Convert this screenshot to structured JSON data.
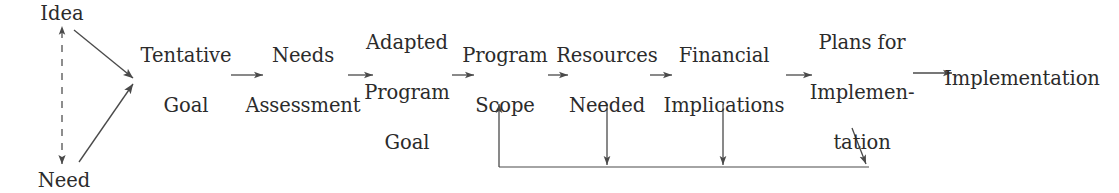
{
  "diagram": {
    "background_color": "#ffffff",
    "ink_color": "#2b2b2b",
    "line_color": "#4a4a4a",
    "inputs": [
      {
        "id": "idea",
        "label": "Idea",
        "cx": 62,
        "cy": 14
      },
      {
        "id": "need",
        "label": "Need",
        "cx": 64,
        "cy": 181
      }
    ],
    "stages": [
      {
        "id": "tentative-goal",
        "lines": [
          "Tentative",
          "Goal"
        ],
        "cx": 186,
        "cy": 80
      },
      {
        "id": "needs-assessment",
        "lines": [
          "Needs",
          "Assessment"
        ],
        "cx": 303,
        "cy": 80
      },
      {
        "id": "adapted-program-goal",
        "lines": [
          "Adapted",
          "Program",
          "Goal"
        ],
        "cx": 407,
        "cy": 92
      },
      {
        "id": "program-scope",
        "lines": [
          "Program",
          "Scope",
          ""
        ],
        "cx": 505,
        "cy": 80
      },
      {
        "id": "resources-needed",
        "lines": [
          "Resources",
          "Needed"
        ],
        "cx": 607,
        "cy": 80
      },
      {
        "id": "financial-implications",
        "lines": [
          "Financial",
          "Implications"
        ],
        "cx": 724,
        "cy": 80
      },
      {
        "id": "plans-for-implementation",
        "lines": [
          "Plans for",
          "Implemen-",
          "tation"
        ],
        "cx": 862,
        "cy": 92
      },
      {
        "id": "implementation",
        "lines": [
          "Implementation"
        ],
        "cx": 1022,
        "cy": 78
      }
    ],
    "forward_arrows": [
      {
        "id": "tentative-to-needs",
        "x1": 231,
        "y1": 75,
        "x2": 263,
        "y2": 75
      },
      {
        "id": "needs-to-adapted",
        "x1": 348,
        "y1": 75,
        "x2": 373,
        "y2": 75
      },
      {
        "id": "adapted-to-scope",
        "x1": 452,
        "y1": 75,
        "x2": 474,
        "y2": 75
      },
      {
        "id": "scope-to-resources",
        "x1": 548,
        "y1": 75,
        "x2": 568,
        "y2": 75
      },
      {
        "id": "resources-to-financial",
        "x1": 650,
        "y1": 75,
        "x2": 672,
        "y2": 75
      },
      {
        "id": "financial-to-plans",
        "x1": 786,
        "y1": 75,
        "x2": 812,
        "y2": 75
      },
      {
        "id": "plans-to-implementation",
        "x1": 913,
        "y1": 73,
        "x2": 952,
        "y2": 73
      }
    ],
    "input_arrows": [
      {
        "id": "idea-to-tentative-goal",
        "x1": 74,
        "y1": 30,
        "x2": 133,
        "y2": 78
      },
      {
        "id": "need-to-tentative-goal",
        "x1": 79,
        "y1": 162,
        "x2": 133,
        "y2": 84
      }
    ],
    "dashed_connector": {
      "id": "idea-need-dashed-link",
      "x": 62,
      "y1": 26,
      "y2": 164,
      "style": "dashed",
      "arrowheads": "both"
    },
    "feedback_loop": {
      "id": "feedback-loop",
      "baseline_y": 167,
      "left_x": 499,
      "right_x": 866,
      "return_target_y": 104,
      "branches": [
        {
          "id": "resources-feedback-branch",
          "x": 607,
          "y_top": 104,
          "y_bottom": 165
        },
        {
          "id": "financial-feedback-branch",
          "x": 723,
          "y_top": 104,
          "y_bottom": 165
        },
        {
          "id": "plans-feedback-branch",
          "x1": 853,
          "y_top": 128,
          "x2": 866,
          "y_bottom": 164
        }
      ]
    }
  }
}
